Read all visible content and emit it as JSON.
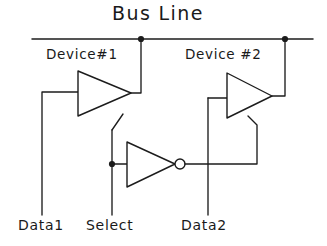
{
  "diagram": {
    "title": "Bus Line",
    "type": "tri-state-bus-schematic",
    "labels": {
      "device1": "Device#1",
      "device2": "Device #2",
      "data1": "Data1",
      "select": "Select",
      "data2": "Data2"
    },
    "colors": {
      "ink": "#1c1c1c",
      "background": "#ffffff"
    },
    "nodes": [
      {
        "name": "bus-junction-device1",
        "x": 141,
        "y": 39
      },
      {
        "name": "bus-junction-device2",
        "x": 285,
        "y": 39
      },
      {
        "name": "select-tap-junction",
        "x": 112,
        "y": 164
      }
    ],
    "components": [
      {
        "name": "buffer-device1",
        "kind": "tri-state-buffer",
        "inverted_output": false
      },
      {
        "name": "buffer-device2",
        "kind": "tri-state-buffer",
        "inverted_output": false
      },
      {
        "name": "select-inverter",
        "kind": "inverter",
        "inverted_output": true
      }
    ]
  }
}
